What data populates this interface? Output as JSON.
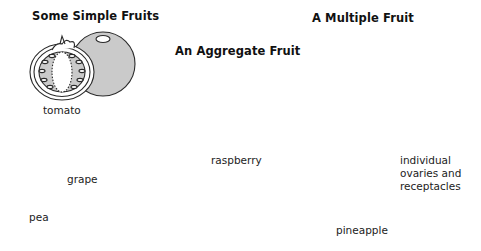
{
  "sections": {
    "simple": {
      "title": "Some Simple Fruits",
      "fruits": [
        {
          "name": "tomato",
          "label": "tomato"
        },
        {
          "name": "grape",
          "label": "grape"
        },
        {
          "name": "pea",
          "label": "pea"
        }
      ]
    },
    "aggregate": {
      "title": "An Aggregate Fruit",
      "fruits": [
        {
          "name": "raspberry",
          "label": "raspberry"
        }
      ]
    },
    "multiple": {
      "title": "A Multiple Fruit",
      "fruits": [
        {
          "name": "pineapple",
          "label": "pineapple"
        }
      ],
      "annotation": [
        "individual",
        "ovaries and",
        "receptacles"
      ]
    }
  },
  "colors": {
    "line": "#2a2a2a",
    "fill": "#c8c8c8",
    "background": "#ffffff"
  }
}
